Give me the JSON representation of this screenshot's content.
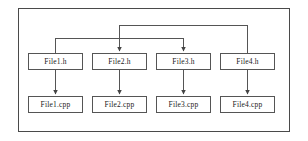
{
  "diagram": {
    "type": "dependency-graph",
    "frame": {
      "border_color": "#4a4a4a",
      "background": "#ffffff"
    },
    "node_style": {
      "border_color": "#555555",
      "fill": "#ffffff",
      "text_color": "#1a1a1a"
    },
    "edge_style": {
      "color": "#555555",
      "arrowhead": "filled-triangle"
    },
    "headers": [
      {
        "id": "file1h",
        "label": "File1.h",
        "x": 28,
        "y": 53,
        "w": 55,
        "h": 17
      },
      {
        "id": "file2h",
        "label": "File2.h",
        "x": 92,
        "y": 53,
        "w": 55,
        "h": 17
      },
      {
        "id": "file3h",
        "label": "File3.h",
        "x": 156,
        "y": 53,
        "w": 55,
        "h": 17
      },
      {
        "id": "file4h",
        "label": "File4.h",
        "x": 220,
        "y": 53,
        "w": 55,
        "h": 17
      }
    ],
    "sources": [
      {
        "id": "file1cpp",
        "label": "File1.cpp",
        "x": 28,
        "y": 96,
        "w": 55,
        "h": 17
      },
      {
        "id": "file2cpp",
        "label": "File2.cpp",
        "x": 92,
        "y": 96,
        "w": 55,
        "h": 17
      },
      {
        "id": "file3cpp",
        "label": "File3.cpp",
        "x": 156,
        "y": 96,
        "w": 55,
        "h": 17
      },
      {
        "id": "file4cpp",
        "label": "File4.cpp",
        "x": 220,
        "y": 96,
        "w": 55,
        "h": 17
      }
    ],
    "edges": [
      {
        "id": "e-h1-cpp1",
        "from": "file1h",
        "to": "file1cpp",
        "kind": "vertical"
      },
      {
        "id": "e-h2-cpp2",
        "from": "file2h",
        "to": "file2cpp",
        "kind": "vertical"
      },
      {
        "id": "e-h3-cpp3",
        "from": "file3h",
        "to": "file3cpp",
        "kind": "vertical"
      },
      {
        "id": "e-h4-cpp4",
        "from": "file4h",
        "to": "file4cpp",
        "kind": "vertical"
      },
      {
        "id": "e-h1-h3",
        "from": "file1h",
        "to": "file3h",
        "kind": "bracket-over"
      },
      {
        "id": "e-h4-h2",
        "from": "file4h",
        "to": "file2h",
        "kind": "bracket-over"
      }
    ]
  }
}
